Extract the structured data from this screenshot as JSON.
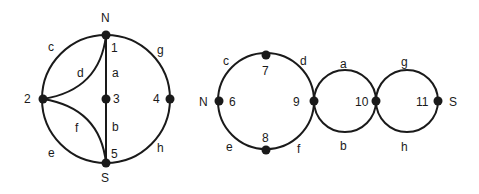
{
  "left_graph": {
    "circle": {
      "cx": 106,
      "cy": 99,
      "r": 64
    },
    "nodes": [
      {
        "id": "1",
        "x": 106,
        "y": 35,
        "label": "1",
        "lx": 111,
        "ly": 52
      },
      {
        "id": "2",
        "x": 43,
        "y": 99,
        "label": "2",
        "lx": 24,
        "ly": 103
      },
      {
        "id": "3",
        "x": 106,
        "y": 99,
        "label": "3",
        "lx": 113,
        "ly": 103
      },
      {
        "id": "4",
        "x": 170,
        "y": 99,
        "label": "4",
        "lx": 153,
        "ly": 103
      },
      {
        "id": "5",
        "x": 106,
        "y": 163,
        "label": "5",
        "lx": 111,
        "ly": 158
      }
    ],
    "terminals": [
      {
        "label": "N",
        "x": 101,
        "y": 22
      },
      {
        "label": "S",
        "x": 101,
        "y": 182
      }
    ],
    "edge_labels": [
      {
        "label": "c",
        "x": 48,
        "y": 51
      },
      {
        "label": "g",
        "x": 157,
        "y": 54
      },
      {
        "label": "d",
        "x": 77,
        "y": 77
      },
      {
        "label": "a",
        "x": 112,
        "y": 77
      },
      {
        "label": "f",
        "x": 75,
        "y": 132
      },
      {
        "label": "b",
        "x": 112,
        "y": 131
      },
      {
        "label": "e",
        "x": 48,
        "y": 157
      },
      {
        "label": "h",
        "x": 157,
        "y": 152
      }
    ]
  },
  "right_graph": {
    "circles": [
      {
        "cx": 266,
        "cy": 101,
        "r": 48
      },
      {
        "cx": 345,
        "cy": 101,
        "r": 31
      },
      {
        "cx": 407,
        "cy": 101,
        "r": 31
      }
    ],
    "nodes": [
      {
        "id": "6",
        "x": 219,
        "y": 101,
        "label": "6",
        "lx": 229,
        "ly": 106
      },
      {
        "id": "7",
        "x": 266,
        "y": 55,
        "label": "7",
        "lx": 262,
        "ly": 75
      },
      {
        "id": "8",
        "x": 266,
        "y": 150,
        "label": "8",
        "lx": 262,
        "ly": 142
      },
      {
        "id": "9",
        "x": 314,
        "y": 101,
        "label": "9",
        "lx": 293,
        "ly": 106
      },
      {
        "id": "10",
        "x": 376,
        "y": 101,
        "label": "10",
        "lx": 355,
        "ly": 106
      },
      {
        "id": "11",
        "x": 438,
        "y": 101,
        "label": "11",
        "lx": 416,
        "ly": 106
      }
    ],
    "terminals": [
      {
        "label": "N",
        "x": 199,
        "y": 106
      },
      {
        "label": "S",
        "x": 449,
        "y": 106
      }
    ],
    "edge_labels": [
      {
        "label": "c",
        "x": 223,
        "y": 65
      },
      {
        "label": "d",
        "x": 300,
        "y": 65
      },
      {
        "label": "e",
        "x": 226,
        "y": 151
      },
      {
        "label": "f",
        "x": 297,
        "y": 153
      },
      {
        "label": "a",
        "x": 340,
        "y": 68
      },
      {
        "label": "b",
        "x": 340,
        "y": 150
      },
      {
        "label": "g",
        "x": 401,
        "y": 66
      },
      {
        "label": "h",
        "x": 401,
        "y": 151
      }
    ]
  }
}
